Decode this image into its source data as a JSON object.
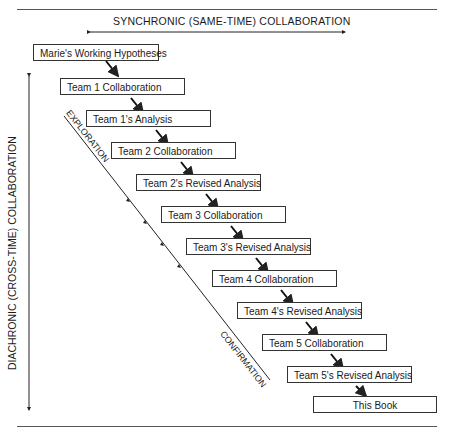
{
  "diagram": {
    "top_label": "SYNCHRONIC (SAME-TIME) COLLABORATION",
    "left_label": "DIACHRONIC (CROSS-TIME) COLLABORATION",
    "diag_top_label": "EXPLORATION",
    "diag_bottom_label": "CONFIRMATION",
    "steps": [
      {
        "label": "Marie's Working Hypotheses"
      },
      {
        "label": "Team 1 Collaboration"
      },
      {
        "label": "Team 1's Analysis"
      },
      {
        "label": "Team 2 Collaboration"
      },
      {
        "label": "Team 2's Revised Analysis"
      },
      {
        "label": "Team 3 Collaboration"
      },
      {
        "label": "Team 3's Revised Analysis"
      },
      {
        "label": "Team 4 Collaboration"
      },
      {
        "label": "Team 4's Revised Analysis"
      },
      {
        "label": "Team 5 Collaboration"
      },
      {
        "label": "Team 5's Revised Analysis"
      },
      {
        "label": "This Book"
      }
    ]
  }
}
